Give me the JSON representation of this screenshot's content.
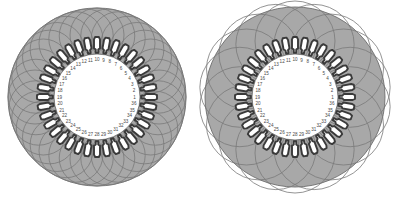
{
  "figure": {
    "background_color": "#ffffff",
    "panel_count": 2
  },
  "style": {
    "core_fill": "#a8a8a8",
    "core_stroke": "#6d6d6d",
    "bore_fill": "#ffffff",
    "slot_fill": "#ffffff",
    "slot_stroke": "#3a3a3a",
    "coil_stroke": "#7a7a7a",
    "label_color": "#4a4a4a"
  },
  "slot_numbers": [
    1,
    2,
    3,
    4,
    5,
    6,
    7,
    8,
    9,
    10,
    11,
    12,
    13,
    14,
    15,
    16,
    17,
    18,
    19,
    20,
    21,
    22,
    23,
    24,
    25,
    26,
    27,
    28,
    29,
    30,
    31,
    32,
    33,
    34,
    35,
    36
  ],
  "panels": [
    {
      "name": "left-stator-diagram",
      "slot_count": 36,
      "coil_count": 36,
      "coil_pitch_slots": 7,
      "cx": 97,
      "cy": 97,
      "outer_radius": 89,
      "core_inner_radius": 60,
      "bore_radius": 43,
      "coil_arc_radius": 27,
      "coil_ring_radius": 62
    },
    {
      "name": "right-stator-diagram",
      "slot_count": 36,
      "coil_count": 18,
      "coil_pitch_slots": 12,
      "cx": 99,
      "cy": 97,
      "outer_radius": 90,
      "core_inner_radius": 60,
      "bore_radius": 43,
      "coil_arc_radius": 40,
      "coil_ring_radius": 56
    }
  ],
  "chart_data": {
    "type": "diagram",
    "categories": [
      "left (short-pitch, 36 coils)",
      "right (full-pitch, 18 coils)"
    ],
    "values": [
      36,
      18
    ],
    "labels": [
      "1",
      "2",
      "3",
      "4",
      "5",
      "6",
      "7",
      "8",
      "9",
      "10",
      "11",
      "12",
      "13",
      "14",
      "15",
      "16",
      "17",
      "18",
      "19",
      "20",
      "21",
      "22",
      "23",
      "24",
      "25",
      "26",
      "27",
      "28",
      "29",
      "30",
      "31",
      "32",
      "33",
      "34",
      "35",
      "36"
    ],
    "xlabel": "",
    "ylabel": ""
  }
}
